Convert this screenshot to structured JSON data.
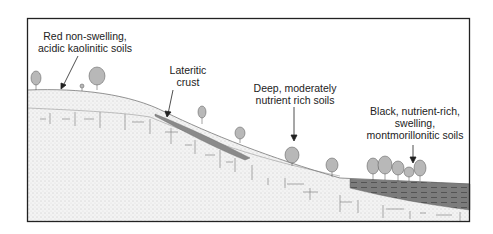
{
  "figure": {
    "frame": {
      "x": 27,
      "y": 18,
      "width": 443,
      "height": 204
    },
    "colors": {
      "frame": "#222222",
      "soil_fill": "#f1f1f1",
      "soil_dots": "#9a9a9a",
      "laterite": "#8a8a8a",
      "black_soil": "#7a7a7a",
      "black_soil_dash": "#4a4a4a",
      "tree": "#b5b5b5",
      "tree_outline": "#555555",
      "text": "#222222"
    }
  },
  "labels": [
    {
      "id": "red-soils",
      "lines": [
        "Red non-swelling,",
        "acidic kaolinitic soils"
      ]
    },
    {
      "id": "lateritic-crust",
      "lines": [
        "Lateritic",
        "crust"
      ]
    },
    {
      "id": "deep-soils",
      "lines": [
        "Deep, moderately",
        "nutrient rich soils"
      ]
    },
    {
      "id": "black-soils",
      "lines": [
        "Black, nutrient-rich,",
        "swelling,",
        "montmorillonitic soils"
      ]
    }
  ]
}
